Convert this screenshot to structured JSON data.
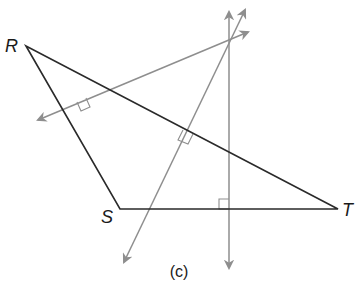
{
  "figure": {
    "caption": "(c)",
    "vertices": [
      {
        "label": "R",
        "x": 26,
        "y": 46
      },
      {
        "label": "S",
        "x": 120,
        "y": 209
      },
      {
        "label": "T",
        "x": 338,
        "y": 209
      }
    ],
    "concurrency_point": {
      "x": 229,
      "y": 44
    },
    "colors": {
      "triangle": "#2a2a2a",
      "perpendiculars": "#8e8e8e",
      "background": "#ffffff"
    },
    "right_angle_marks": 3,
    "perpendicular_lines": 3
  }
}
